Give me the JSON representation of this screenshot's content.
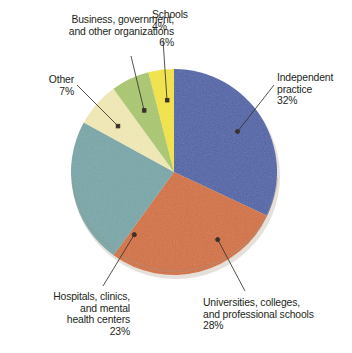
{
  "chart_data": {
    "type": "pie",
    "title": "",
    "subtitle": "",
    "xlabel": "",
    "ylabel": "",
    "legend_position": "none",
    "grid": false,
    "units": "percent",
    "categories": [
      "Independent practice",
      "Universities, colleges, and professional schools",
      "Hospitals, clinics, and mental health centers",
      "Other",
      "Business, government, and other organizations",
      "Schools"
    ],
    "values": [
      32,
      28,
      23,
      7,
      6,
      4
    ],
    "colors": [
      "#4f63a8",
      "#d4703d",
      "#78a7a9",
      "#f2eab5",
      "#aac86d",
      "#f4e53c"
    ],
    "start_angle_deg": 0,
    "direction": "clockwise",
    "slices": [
      {
        "label": "Independent practice",
        "value": 32,
        "value_text": "32%",
        "color": "#4f63a8"
      },
      {
        "label": "Universities, colleges, and professional schools",
        "value": 28,
        "value_text": "28%",
        "color": "#d4703d"
      },
      {
        "label": "Hospitals, clinics, and mental health centers",
        "value": 23,
        "value_text": "23%",
        "color": "#78a7a9"
      },
      {
        "label": "Other",
        "value": 7,
        "value_text": "7%",
        "color": "#f2eab5"
      },
      {
        "label": "Business, government, and other organizations",
        "value": 6,
        "value_text": "6%",
        "color": "#aac86d"
      },
      {
        "label": "Schools",
        "value": 4,
        "value_text": "4%",
        "color": "#f4e53c"
      }
    ]
  },
  "labels": {
    "business": {
      "line1": "Business, government,",
      "line2": "and other organizations",
      "percent": "6%"
    },
    "schools": {
      "line1": "Schools",
      "percent": "4%"
    },
    "other": {
      "line1": "Other",
      "percent": "7%"
    },
    "independent": {
      "line1": "Independent",
      "line2": "practice",
      "percent": "32%"
    },
    "hospitals": {
      "line1": "Hospitals, clinics,",
      "line2": "and mental",
      "line3": "health centers",
      "percent": "23%"
    },
    "universities": {
      "line1": "Universities, colleges,",
      "line2": "and professional schools",
      "percent": "28%"
    }
  },
  "style": {
    "text_color": "#231f20",
    "leader_color": "#3a3128",
    "background": "#ffffff",
    "pie_edge": "#b9b0a4"
  }
}
